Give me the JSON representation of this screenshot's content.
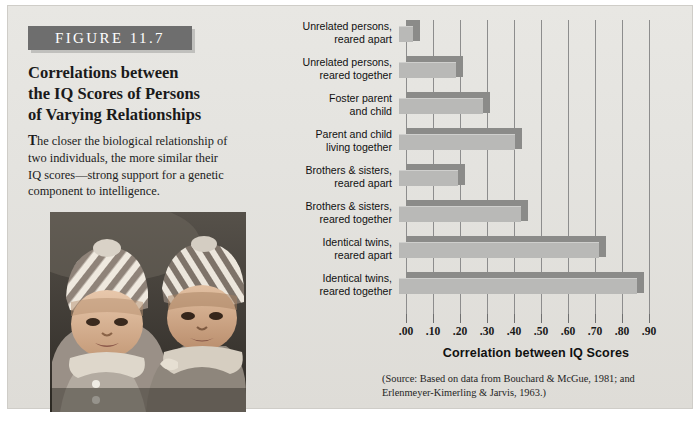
{
  "figure": {
    "tag": "FIGURE 11.7",
    "title_lines": [
      "Correlations between",
      "the IQ Scores of Persons",
      "of Varying Relationships"
    ],
    "caption_dropcap": "T",
    "caption_rest": "he closer the biological relationship of two individuals, the more similar their IQ scores—strong support for a genetic component to intelligence.",
    "photo_alt": "two-infants-in-striped-hats-photo"
  },
  "chart_data": {
    "type": "bar",
    "orientation": "horizontal",
    "title": "Correlations between the IQ Scores of Persons of Varying Relationships",
    "xlabel": "Correlation between IQ Scores",
    "ylabel": "",
    "xlim": [
      0.0,
      1.0
    ],
    "grid": true,
    "legend": "none",
    "tick_labels": [
      ".00",
      ".10",
      ".20",
      ".30",
      ".40",
      ".50",
      ".60",
      ".70",
      ".80",
      ".90"
    ],
    "tick_values": [
      0.0,
      0.1,
      0.2,
      0.3,
      0.4,
      0.5,
      0.6,
      0.7,
      0.8,
      0.9
    ],
    "categories": [
      [
        "Unrelated persons,",
        "reared apart"
      ],
      [
        "Unrelated persons,",
        "reared together"
      ],
      [
        "Foster parent",
        "and child"
      ],
      [
        "Parent and child",
        "living together"
      ],
      [
        "Brothers & sisters,",
        "reared apart"
      ],
      [
        "Brothers & sisters,",
        "reared together"
      ],
      [
        "Identical twins,",
        "reared apart"
      ],
      [
        "Identical twins,",
        "reared together"
      ]
    ],
    "values": [
      0.05,
      0.21,
      0.31,
      0.43,
      0.22,
      0.45,
      0.74,
      0.88
    ]
  },
  "source": {
    "line1": "(Source: Based on data from Bouchard & McGue, 1981; and",
    "line2": "Erlenmeyer-Kimerling & Jarvis, 1963.)"
  },
  "colors": {
    "panel_background": "#e6e5e1",
    "tag_background": "#6e6e6e",
    "bar_face": "#b9b9b7",
    "bar_shade": "#8b8b89",
    "gridline": "#8d8d8d",
    "text": "#111111"
  }
}
